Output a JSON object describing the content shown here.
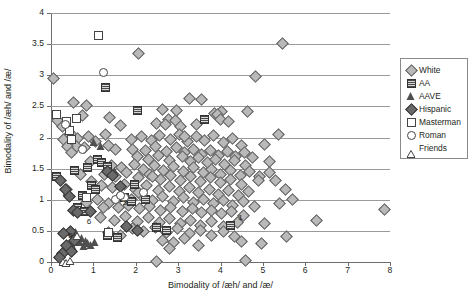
{
  "chart_data": {
    "type": "scatter",
    "title": "",
    "xlabel": "Bimodality of /æh/ and /æ/",
    "ylabel": "Bimodality of /æh/ and /æ/",
    "xlim": [
      0,
      8
    ],
    "ylim": [
      0,
      4
    ],
    "xticks": [
      "0",
      "1",
      "2",
      "3",
      "4",
      "5",
      "6",
      "7",
      "8"
    ],
    "yticks": [
      "0",
      "0.5",
      "1",
      "1.5",
      "2",
      "2.5",
      "3",
      "3.5",
      "4"
    ],
    "grid": "horizontal",
    "legend_position": "right",
    "legend": [
      {
        "name": "White",
        "marker": "diamond-light"
      },
      {
        "name": "AA",
        "marker": "checkered-square"
      },
      {
        "name": "AAVE",
        "marker": "filled-triangle"
      },
      {
        "name": "Hispanic",
        "marker": "filled-diamond"
      },
      {
        "name": "Masterman",
        "marker": "open-square"
      },
      {
        "name": "Roman",
        "marker": "open-circle"
      },
      {
        "name": "Friends",
        "marker": "open-triangle"
      }
    ],
    "annotations": [
      {
        "label": "1",
        "x": 4.35,
        "y": 0.62
      },
      {
        "label": "3",
        "x": 1.62,
        "y": 0.86
      },
      {
        "label": "5",
        "x": 0.33,
        "y": 0.33
      },
      {
        "label": "6",
        "x": 0.77,
        "y": 0.56
      }
    ],
    "series": [
      {
        "name": "White",
        "marker": "diamond-light",
        "points": [
          [
            0.05,
            2.96
          ],
          [
            5.45,
            3.52
          ],
          [
            2.05,
            3.35
          ],
          [
            4.82,
            2.98
          ],
          [
            0.52,
            2.57
          ],
          [
            0.82,
            2.53
          ],
          [
            3.25,
            2.64
          ],
          [
            3.55,
            2.62
          ],
          [
            2.62,
            2.46
          ],
          [
            4.02,
            2.42
          ],
          [
            4.62,
            2.42
          ],
          [
            3.85,
            2.39
          ],
          [
            0.72,
            2.36
          ],
          [
            1.38,
            2.33
          ],
          [
            3.92,
            2.37
          ],
          [
            1.62,
            2.2
          ],
          [
            2.75,
            2.3
          ],
          [
            2.92,
            2.28
          ],
          [
            3.98,
            2.3
          ],
          [
            4.18,
            2.26
          ],
          [
            2.48,
            2.24
          ],
          [
            2.68,
            2.22
          ],
          [
            3.05,
            2.18
          ],
          [
            0.42,
            2.05
          ],
          [
            0.52,
            2.02
          ],
          [
            0.62,
            2.0
          ],
          [
            0.88,
            2.02
          ],
          [
            1.05,
            1.95
          ],
          [
            1.28,
            2.06
          ],
          [
            1.35,
            1.88
          ],
          [
            1.88,
            1.98
          ],
          [
            2.12,
            2.02
          ],
          [
            2.35,
            1.96
          ],
          [
            2.55,
            2.04
          ],
          [
            2.82,
            1.98
          ],
          [
            3.02,
            2.06
          ],
          [
            3.22,
            1.94
          ],
          [
            3.42,
            2.02
          ],
          [
            3.62,
            1.96
          ],
          [
            3.82,
            2.04
          ],
          [
            4.05,
            1.92
          ],
          [
            4.28,
            2.0
          ],
          [
            4.48,
            1.88
          ],
          [
            5.02,
            1.9
          ],
          [
            5.35,
            2.06
          ],
          [
            0.58,
            1.86
          ],
          [
            0.78,
            1.84
          ],
          [
            1.92,
            1.82
          ],
          [
            2.22,
            1.8
          ],
          [
            2.45,
            1.86
          ],
          [
            2.72,
            1.78
          ],
          [
            2.95,
            1.84
          ],
          [
            3.15,
            1.76
          ],
          [
            3.35,
            1.82
          ],
          [
            3.55,
            1.74
          ],
          [
            3.75,
            1.8
          ],
          [
            3.95,
            1.72
          ],
          [
            4.15,
            1.78
          ],
          [
            4.35,
            1.7
          ],
          [
            4.55,
            1.76
          ],
          [
            4.75,
            1.68
          ],
          [
            2.02,
            1.7
          ],
          [
            2.28,
            1.66
          ],
          [
            2.52,
            1.72
          ],
          [
            2.78,
            1.64
          ],
          [
            3.08,
            1.7
          ],
          [
            3.28,
            1.62
          ],
          [
            3.48,
            1.68
          ],
          [
            3.68,
            1.6
          ],
          [
            3.88,
            1.66
          ],
          [
            4.08,
            1.58
          ],
          [
            4.32,
            1.64
          ],
          [
            4.58,
            1.56
          ],
          [
            5.15,
            1.62
          ],
          [
            1.42,
            1.56
          ],
          [
            1.65,
            1.52
          ],
          [
            1.95,
            1.58
          ],
          [
            2.18,
            1.5
          ],
          [
            2.42,
            1.56
          ],
          [
            2.65,
            1.48
          ],
          [
            2.88,
            1.54
          ],
          [
            3.12,
            1.46
          ],
          [
            3.35,
            1.52
          ],
          [
            3.58,
            1.44
          ],
          [
            3.78,
            1.5
          ],
          [
            3.98,
            1.42
          ],
          [
            4.22,
            1.48
          ],
          [
            4.45,
            1.4
          ],
          [
            4.68,
            1.46
          ],
          [
            4.92,
            1.38
          ],
          [
            1.25,
            1.42
          ],
          [
            1.52,
            1.38
          ],
          [
            1.78,
            1.44
          ],
          [
            2.05,
            1.36
          ],
          [
            2.32,
            1.42
          ],
          [
            2.58,
            1.34
          ],
          [
            2.82,
            1.4
          ],
          [
            3.05,
            1.32
          ],
          [
            3.28,
            1.38
          ],
          [
            3.52,
            1.3
          ],
          [
            3.75,
            1.36
          ],
          [
            3.98,
            1.28
          ],
          [
            4.22,
            1.34
          ],
          [
            4.48,
            1.26
          ],
          [
            5.28,
            1.32
          ],
          [
            0.35,
            1.18
          ],
          [
            0.95,
            1.3
          ],
          [
            1.18,
            1.24
          ],
          [
            1.45,
            1.2
          ],
          [
            1.72,
            1.26
          ],
          [
            1.98,
            1.18
          ],
          [
            2.25,
            1.24
          ],
          [
            2.52,
            1.16
          ],
          [
            2.78,
            1.22
          ],
          [
            3.02,
            1.14
          ],
          [
            3.25,
            1.2
          ],
          [
            3.48,
            1.12
          ],
          [
            3.72,
            1.18
          ],
          [
            3.95,
            1.1
          ],
          [
            4.18,
            1.16
          ],
          [
            4.42,
            1.08
          ],
          [
            4.65,
            1.14
          ],
          [
            5.52,
            1.18
          ],
          [
            1.62,
            1.06
          ],
          [
            1.88,
            1.02
          ],
          [
            2.12,
            1.08
          ],
          [
            2.38,
            1.0
          ],
          [
            2.62,
            1.06
          ],
          [
            2.88,
            0.98
          ],
          [
            3.12,
            1.04
          ],
          [
            3.35,
            0.96
          ],
          [
            3.58,
            1.02
          ],
          [
            3.82,
            0.94
          ],
          [
            4.05,
            1.0
          ],
          [
            4.28,
            0.92
          ],
          [
            4.52,
            0.98
          ],
          [
            4.78,
            0.9
          ],
          [
            5.68,
            1.02
          ],
          [
            1.35,
            0.94
          ],
          [
            1.58,
            0.88
          ],
          [
            1.82,
            0.92
          ],
          [
            2.08,
            0.86
          ],
          [
            2.32,
            0.9
          ],
          [
            2.58,
            0.84
          ],
          [
            2.82,
            0.88
          ],
          [
            3.08,
            0.82
          ],
          [
            3.32,
            0.86
          ],
          [
            3.55,
            0.8
          ],
          [
            3.78,
            0.84
          ],
          [
            4.02,
            0.78
          ],
          [
            4.25,
            0.82
          ],
          [
            4.52,
            0.76
          ],
          [
            6.25,
            0.67
          ],
          [
            7.85,
            0.85
          ],
          [
            1.15,
            0.72
          ],
          [
            1.48,
            0.68
          ],
          [
            1.75,
            0.74
          ],
          [
            2.02,
            0.66
          ],
          [
            2.28,
            0.72
          ],
          [
            2.55,
            0.64
          ],
          [
            2.78,
            0.7
          ],
          [
            3.05,
            0.62
          ],
          [
            3.28,
            0.68
          ],
          [
            3.52,
            0.6
          ],
          [
            3.78,
            0.66
          ],
          [
            4.05,
            0.58
          ],
          [
            4.38,
            0.64
          ],
          [
            5.02,
            0.62
          ],
          [
            1.92,
            0.54
          ],
          [
            2.18,
            0.5
          ],
          [
            2.45,
            0.56
          ],
          [
            2.72,
            0.48
          ],
          [
            2.98,
            0.54
          ],
          [
            3.25,
            0.46
          ],
          [
            3.52,
            0.52
          ],
          [
            3.78,
            0.44
          ],
          [
            4.05,
            0.5
          ],
          [
            4.32,
            0.42
          ],
          [
            1.35,
            0.48
          ],
          [
            1.62,
            0.44
          ],
          [
            2.62,
            0.36
          ],
          [
            2.88,
            0.32
          ],
          [
            3.15,
            0.38
          ],
          [
            3.48,
            0.28
          ],
          [
            4.48,
            0.34
          ],
          [
            4.95,
            0.3
          ],
          [
            5.55,
            0.42
          ],
          [
            2.48,
            0.02
          ],
          [
            4.58,
            0.03
          ],
          [
            2.78,
            0.22
          ],
          [
            0.15,
            2.28
          ],
          [
            0.28,
            1.98
          ],
          [
            0.38,
            1.86
          ],
          [
            0.48,
            1.76
          ],
          [
            0.25,
            2.18
          ],
          [
            3.15,
            2.02
          ],
          [
            2.38,
            1.38
          ],
          [
            2.05,
            1.12
          ],
          [
            5.15,
            1.45
          ],
          [
            4.88,
            1.32
          ],
          [
            5.38,
            0.95
          ],
          [
            3.42,
            2.22
          ],
          [
            2.95,
            2.44
          ],
          [
            1.52,
            1.82
          ],
          [
            0.92,
            1.62
          ],
          [
            0.68,
            1.42
          ],
          [
            1.08,
            1.02
          ],
          [
            0.82,
            0.96
          ],
          [
            1.22,
            0.88
          ]
        ]
      },
      {
        "name": "AA",
        "marker": "checkered-square",
        "points": [
          [
            1.28,
            2.81
          ],
          [
            2.02,
            2.44
          ],
          [
            3.62,
            2.29
          ],
          [
            1.08,
            1.66
          ],
          [
            1.18,
            1.6
          ],
          [
            1.32,
            1.54
          ],
          [
            0.12,
            1.38
          ],
          [
            0.95,
            1.24
          ],
          [
            1.05,
            1.18
          ],
          [
            0.72,
            1.08
          ],
          [
            1.72,
            1.04
          ],
          [
            1.88,
            0.98
          ],
          [
            0.62,
            0.88
          ],
          [
            0.78,
            0.82
          ],
          [
            2.48,
            0.56
          ],
          [
            2.72,
            0.52
          ],
          [
            1.32,
            0.44
          ],
          [
            1.55,
            0.4
          ],
          [
            4.22,
            0.6
          ],
          [
            0.55,
            1.48
          ],
          [
            0.85,
            1.52
          ],
          [
            2.22,
            1.02
          ],
          [
            1.95,
            1.26
          ]
        ]
      },
      {
        "name": "AAVE",
        "marker": "filled-triangle",
        "points": [
          [
            1.02,
            1.92
          ],
          [
            1.18,
            1.86
          ],
          [
            1.52,
            1.46
          ],
          [
            0.38,
            1.12
          ],
          [
            0.48,
            0.52
          ],
          [
            0.58,
            0.48
          ],
          [
            0.62,
            0.42
          ],
          [
            0.72,
            0.38
          ],
          [
            0.82,
            0.34
          ],
          [
            0.88,
            0.3
          ],
          [
            0.95,
            0.28
          ],
          [
            0.52,
            0.26
          ],
          [
            0.42,
            0.24
          ],
          [
            0.35,
            0.22
          ],
          [
            0.28,
            0.2
          ],
          [
            0.68,
            0.32
          ],
          [
            0.78,
            0.26
          ],
          [
            1.05,
            0.32
          ]
        ]
      },
      {
        "name": "Hispanic",
        "marker": "filled-diamond",
        "points": [
          [
            0.22,
            1.32
          ],
          [
            0.32,
            1.18
          ],
          [
            0.42,
            1.06
          ],
          [
            0.52,
            0.84
          ],
          [
            0.62,
            0.8
          ],
          [
            0.45,
            0.5
          ],
          [
            0.55,
            0.36
          ],
          [
            0.35,
            0.28
          ],
          [
            0.48,
            0.18
          ],
          [
            0.25,
            0.14
          ],
          [
            1.32,
            1.46
          ],
          [
            1.45,
            1.4
          ],
          [
            1.62,
            1.22
          ],
          [
            1.78,
            0.58
          ],
          [
            2.02,
            0.52
          ],
          [
            0.18,
            0.08
          ],
          [
            0.92,
            0.82
          ],
          [
            0.28,
            0.46
          ]
        ]
      },
      {
        "name": "Masterman",
        "marker": "open-square",
        "points": [
          [
            1.12,
            3.64
          ],
          [
            0.12,
            2.38
          ],
          [
            0.35,
            2.26
          ],
          [
            0.42,
            2.12
          ],
          [
            0.48,
            1.98
          ],
          [
            0.82,
            1.04
          ],
          [
            1.35,
            0.48
          ],
          [
            0.58,
            2.32
          ]
        ]
      },
      {
        "name": "Roman",
        "marker": "open-circle",
        "points": [
          [
            1.22,
            3.06
          ],
          [
            0.32,
            2.22
          ],
          [
            0.72,
            1.82
          ],
          [
            1.52,
            1.02
          ],
          [
            1.72,
            1.04
          ],
          [
            2.18,
            1.12
          ],
          [
            1.62,
            1.08
          ]
        ]
      },
      {
        "name": "Friends",
        "marker": "open-triangle",
        "points": [
          [
            0.62,
            0.52
          ],
          [
            0.28,
            0.1
          ],
          [
            0.35,
            0.08
          ],
          [
            0.45,
            0.12
          ]
        ]
      }
    ]
  }
}
